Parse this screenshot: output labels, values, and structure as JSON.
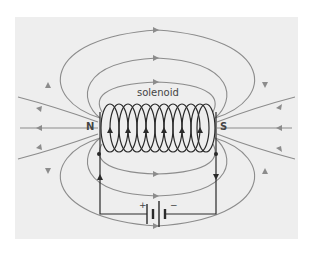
{
  "diagram": {
    "title_label": "solenoid",
    "north_label": "N",
    "south_label": "S",
    "battery": {
      "plus_label": "+",
      "minus_label": "−"
    },
    "colors": {
      "background": "#eeeeee",
      "field_lines": "#8c8c8c",
      "coil": "#2a2a2a",
      "circuit": "#2a2a2a"
    }
  }
}
